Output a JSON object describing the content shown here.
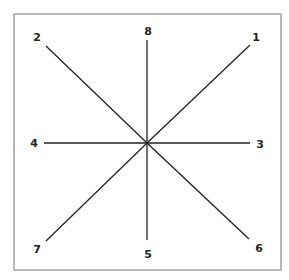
{
  "diagram": {
    "frame": {
      "x": 14,
      "y": 14,
      "width": 267,
      "height": 256,
      "stroke": "#8a8a8a"
    },
    "center": {
      "x": 147,
      "y": 143
    },
    "line_color": "#222222",
    "rays": [
      {
        "label": "1",
        "end": {
          "x": 250,
          "y": 45
        },
        "label_pos": {
          "x": 256,
          "y": 41
        }
      },
      {
        "label": "2",
        "end": {
          "x": 46,
          "y": 46
        },
        "label_pos": {
          "x": 37,
          "y": 41
        }
      },
      {
        "label": "3",
        "end": {
          "x": 250,
          "y": 143
        },
        "label_pos": {
          "x": 260,
          "y": 148
        }
      },
      {
        "label": "4",
        "end": {
          "x": 44,
          "y": 143
        },
        "label_pos": {
          "x": 34,
          "y": 147
        }
      },
      {
        "label": "5",
        "end": {
          "x": 147,
          "y": 240
        },
        "label_pos": {
          "x": 148,
          "y": 258
        }
      },
      {
        "label": "6",
        "end": {
          "x": 249,
          "y": 239
        },
        "label_pos": {
          "x": 259,
          "y": 252
        }
      },
      {
        "label": "7",
        "end": {
          "x": 46,
          "y": 241
        },
        "label_pos": {
          "x": 37,
          "y": 253
        }
      },
      {
        "label": "8",
        "end": {
          "x": 147,
          "y": 40
        },
        "label_pos": {
          "x": 148,
          "y": 35
        }
      }
    ]
  }
}
